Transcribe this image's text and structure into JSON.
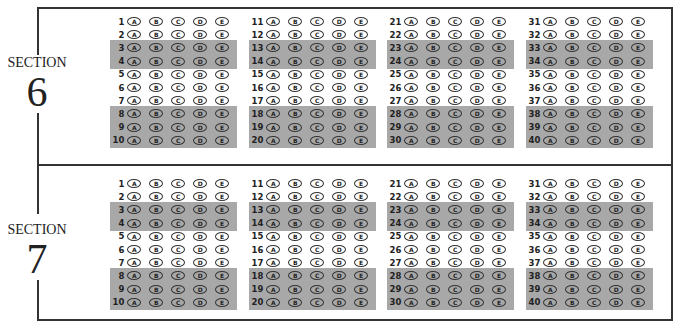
{
  "sections": [
    {
      "label": "SECTION",
      "number": "6",
      "columns": [
        {
          "questions": [
            "1",
            "2",
            "3",
            "4",
            "5",
            "6",
            "7",
            "8",
            "9",
            "10"
          ]
        },
        {
          "questions": [
            "11",
            "12",
            "13",
            "14",
            "15",
            "16",
            "17",
            "18",
            "19",
            "20"
          ]
        },
        {
          "questions": [
            "21",
            "22",
            "23",
            "24",
            "25",
            "26",
            "27",
            "28",
            "29",
            "30"
          ]
        },
        {
          "questions": [
            "31",
            "32",
            "33",
            "34",
            "35",
            "36",
            "37",
            "38",
            "39",
            "40"
          ]
        }
      ]
    },
    {
      "label": "SECTION",
      "number": "7",
      "columns": [
        {
          "questions": [
            "1",
            "2",
            "3",
            "4",
            "5",
            "6",
            "7",
            "8",
            "9",
            "10"
          ]
        },
        {
          "questions": [
            "11",
            "12",
            "13",
            "14",
            "15",
            "16",
            "17",
            "18",
            "19",
            "20"
          ]
        },
        {
          "questions": [
            "21",
            "22",
            "23",
            "24",
            "25",
            "26",
            "27",
            "28",
            "29",
            "30"
          ]
        },
        {
          "questions": [
            "31",
            "32",
            "33",
            "34",
            "35",
            "36",
            "37",
            "38",
            "39",
            "40"
          ]
        }
      ]
    }
  ],
  "choices": [
    "A",
    "B",
    "C",
    "D",
    "E"
  ],
  "shaded_rows": [
    3,
    4,
    8,
    9,
    10
  ],
  "colors": {
    "shade": "#a8a8a8",
    "border": "#333333"
  }
}
